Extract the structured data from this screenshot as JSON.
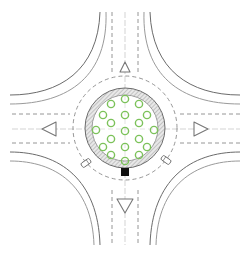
{
  "diagram": {
    "type": "roundabout-plan",
    "width": 250,
    "height": 257,
    "center": [
      125,
      128
    ],
    "colors": {
      "background": "#ffffff",
      "road_edge": "#6b6b6b",
      "road_edge_light": "#9a9a9a",
      "lane_marking": "#8a8a8a",
      "centerline": "#c8c8c8",
      "apron_hatch": "#9c9c9c",
      "apron_fill": "#e6e6e6",
      "island_fill": "#ffffff",
      "tree": "#7cc25a",
      "monument": "#111111",
      "splitter": "#777777",
      "vehicle": "#6e6e6e"
    },
    "central_island": {
      "radius": 33,
      "apron_outer_radius": 40
    },
    "circulatory_lane_marking_radius": 52,
    "trees": [
      [
        125,
        99
      ],
      [
        111,
        104
      ],
      [
        139,
        104
      ],
      [
        103,
        115
      ],
      [
        147,
        115
      ],
      [
        125,
        115
      ],
      [
        111,
        123
      ],
      [
        139,
        123
      ],
      [
        96,
        130
      ],
      [
        154,
        130
      ],
      [
        125,
        131
      ],
      [
        111,
        139
      ],
      [
        139,
        139
      ],
      [
        103,
        147
      ],
      [
        147,
        147
      ],
      [
        125,
        147
      ],
      [
        111,
        155
      ],
      [
        139,
        155
      ],
      [
        125,
        161
      ]
    ],
    "monument": {
      "x": 125,
      "y": 172,
      "size": 8
    },
    "splitter_islands": [
      {
        "name": "north",
        "points": "120,72 130,72 125,62"
      },
      {
        "name": "south",
        "points": "117,199 133,199 125,213"
      },
      {
        "name": "west",
        "points": "42,129 56,122 56,136"
      },
      {
        "name": "east",
        "points": "208,129 194,122 194,136"
      }
    ],
    "vehicles": [
      {
        "x": 86,
        "y": 163,
        "angle": 55
      },
      {
        "x": 166,
        "y": 160,
        "angle": -55
      }
    ]
  }
}
